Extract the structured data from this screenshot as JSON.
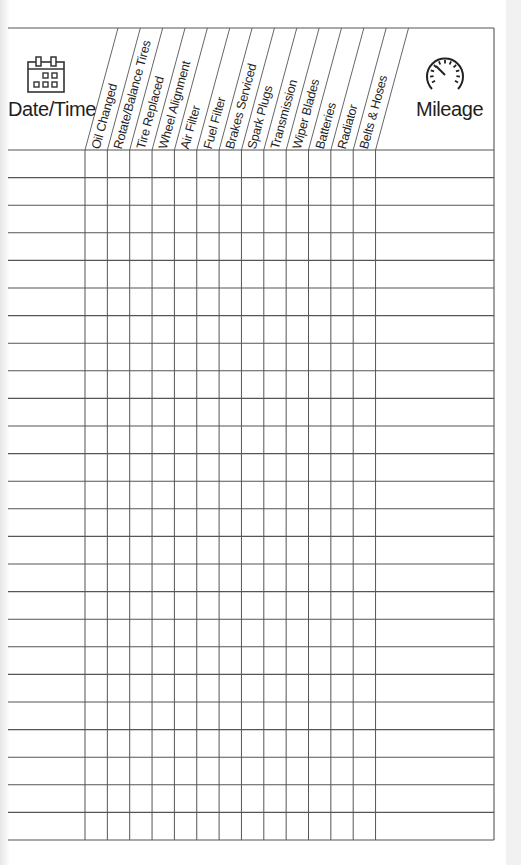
{
  "form": {
    "date_header": "Date/Time",
    "date_icon": "calendar-icon",
    "mileage_header": "Mileage",
    "mileage_icon": "speedometer-icon",
    "service_columns": [
      "Oil Changed",
      "Rotate/Balance Tires",
      "Tire Replaced",
      "Wheel Alignment",
      "Air Filter",
      "Fuel Filter",
      "Brakes Serviced",
      "Spark Plugs",
      "Transmission",
      "Wiper Blades",
      "Batteries",
      "Radiator",
      "Belts & Hoses"
    ],
    "row_count": 25
  },
  "colors": {
    "line": "#555555",
    "text": "#1e1e1e",
    "background": "#f1f1f1",
    "paper": "#ffffff"
  }
}
